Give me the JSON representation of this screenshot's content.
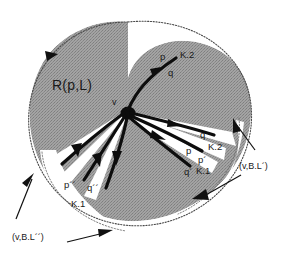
{
  "figure": {
    "background_color": "#ffffff",
    "region_fill_color": "#9a9a9a",
    "stroke_color": "#000000",
    "text_color": "#1a1a1a",
    "width": 289,
    "height": 258
  },
  "labels": {
    "region": "R(p,L)",
    "vertex": "v",
    "top_branch": {
      "p": "p",
      "q": "q",
      "cone": "K.2"
    },
    "right_upper_branch": {
      "q": "q",
      "cone": "K.2"
    },
    "right_lower_branch": {
      "p": "p",
      "p_prime": "p´",
      "q_prime": "q´",
      "cone": "K.1"
    },
    "lower_left_branch": {
      "p_double_prime": "p´´",
      "q_double_prime": "q´´",
      "cone": "K.1"
    },
    "annotation_right": "(v,B.L´)",
    "annotation_bottom_left": "(v,B.L´´)"
  },
  "icons": {
    "vertex_dot": "filled-dot-icon",
    "arrowhead": "arrowhead-icon",
    "pointer_arrow": "pointer-arrow-icon"
  }
}
